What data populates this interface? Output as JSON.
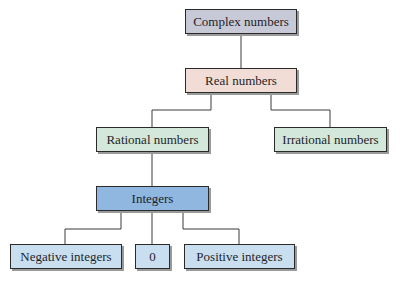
{
  "diagram": {
    "nodes": [
      {
        "id": "complex",
        "label": "Complex numbers",
        "x": 185,
        "y": 9,
        "w": 112,
        "h": 25,
        "color": "#c7c9d6"
      },
      {
        "id": "real",
        "label": "Real numbers",
        "x": 185,
        "y": 68,
        "w": 112,
        "h": 25,
        "color": "#f1ddd5"
      },
      {
        "id": "rational",
        "label": "Rational numbers",
        "x": 96,
        "y": 127,
        "w": 113,
        "h": 25,
        "color": "#d3e8da"
      },
      {
        "id": "irrational",
        "label": "Irrational numbers",
        "x": 274,
        "y": 127,
        "w": 113,
        "h": 25,
        "color": "#d3e8da"
      },
      {
        "id": "integers",
        "label": "Integers",
        "x": 96,
        "y": 186,
        "w": 113,
        "h": 25,
        "color": "#8fb7df"
      },
      {
        "id": "negative",
        "label": "Negative integers",
        "x": 10,
        "y": 244,
        "w": 112,
        "h": 25,
        "color": "#c9dff0"
      },
      {
        "id": "zero",
        "label": "0",
        "x": 135,
        "y": 244,
        "w": 35,
        "h": 25,
        "color": "#c9dff0"
      },
      {
        "id": "positive",
        "label": "Positive integers",
        "x": 184,
        "y": 244,
        "w": 111,
        "h": 25,
        "color": "#c9dff0"
      }
    ],
    "edges": [
      [
        "complex",
        "real"
      ],
      [
        "real",
        "rational"
      ],
      [
        "real",
        "irrational"
      ],
      [
        "rational",
        "integers"
      ],
      [
        "integers",
        "negative"
      ],
      [
        "integers",
        "zero"
      ],
      [
        "integers",
        "positive"
      ]
    ]
  }
}
